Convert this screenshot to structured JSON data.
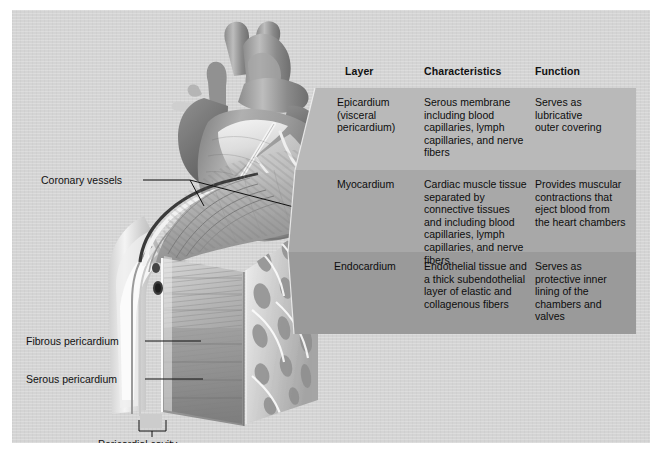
{
  "figure": {
    "panel_bg": "#d4d4d4",
    "title_absent": true
  },
  "table": {
    "headers": [
      "Layer",
      "Characteristics",
      "Function"
    ],
    "row_colors": [
      "#b9b9b9",
      "#a8a8a8",
      "#9a9a9a"
    ],
    "rows": [
      {
        "layer": "Epicardium\n  (visceral\n  pericardium)",
        "characteristics": "Serous membrane\nincluding blood\ncapillaries, lymph\ncapillaries, and nerve\nfibers",
        "function": "Serves as\nlubricative\nouter covering"
      },
      {
        "layer": "Myocardium",
        "characteristics": "Cardiac muscle tissue\nseparated by\nconnective tissues\nand including blood\ncapillaries, lymph\ncapillaries, and nerve\nfibers",
        "function": "Provides muscular\ncontractions that\neject blood from\nthe heart chambers"
      },
      {
        "layer": "Endocardium",
        "characteristics": "Endothelial tissue and\na thick subendothelial\nlayer of elastic and\ncollagenous fibers",
        "function": "Serves as\nprotective inner\nlining of the\nchambers and\nvalves"
      }
    ]
  },
  "labels": {
    "coronary_vessels": "Coronary vessels",
    "fibrous_pericardium": "Fibrous pericardium",
    "serous_pericardium": "Serous pericardium",
    "pericardial_cavity": "Pericardial cavity"
  },
  "illustration": {
    "heart_name": "anterior-heart-illustration",
    "wedge_name": "heart-wall-cross-section",
    "vessel_name": "cut-coronary-vessel"
  }
}
